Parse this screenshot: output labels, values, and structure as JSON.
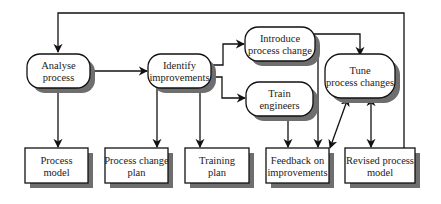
{
  "diagram": {
    "activities": [
      {
        "id": "analyse",
        "lines": [
          "Analyse",
          "process"
        ]
      },
      {
        "id": "identify",
        "lines": [
          "Identify",
          "improvements"
        ]
      },
      {
        "id": "introduce",
        "lines": [
          "Introduce",
          "process change"
        ]
      },
      {
        "id": "train",
        "lines": [
          "Train",
          "engineers"
        ]
      },
      {
        "id": "tune",
        "lines": [
          "Tune",
          "process changes"
        ]
      }
    ],
    "deliverables": [
      {
        "id": "process-model",
        "lines": [
          "Process",
          "model"
        ]
      },
      {
        "id": "process-change-plan",
        "lines": [
          "Process change",
          "plan"
        ]
      },
      {
        "id": "training-plan",
        "lines": [
          "Training",
          "plan"
        ]
      },
      {
        "id": "feedback",
        "lines": [
          "Feedback on",
          "improvements"
        ]
      },
      {
        "id": "revised-model",
        "lines": [
          "Revised process",
          "model"
        ]
      }
    ],
    "colors": {
      "stroke": "#111111",
      "shadow": "#6e6e6e",
      "fill": "#ffffff",
      "text": "#222222"
    }
  }
}
